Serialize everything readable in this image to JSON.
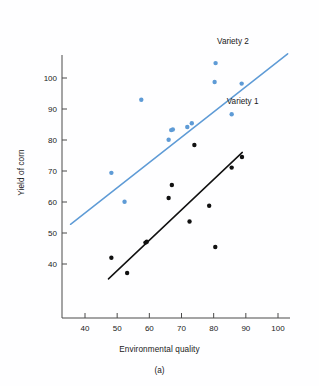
{
  "chart_data": {
    "type": "scatter",
    "title": "",
    "panel_label": "(a)",
    "xlabel": "Environmental quality",
    "ylabel": "Yield of corn",
    "xlim": [
      32,
      104
    ],
    "ylim": [
      30,
      110
    ],
    "xticks": [
      40,
      50,
      60,
      70,
      80,
      90,
      100
    ],
    "yticks": [
      40,
      50,
      60,
      70,
      80,
      90,
      100
    ],
    "grid": false,
    "legend_position": "inline-right-of-line",
    "series": [
      {
        "name": "Variety 2",
        "color": "#5e9bd6",
        "label_x": 86,
        "label_y": 112,
        "fit_line": {
          "x1": 35.5,
          "y1": 52.8,
          "x2": 103.0,
          "y2": 107.8
        },
        "points": [
          {
            "x": 48.2,
            "y": 69.4
          },
          {
            "x": 52.3,
            "y": 60.1
          },
          {
            "x": 57.5,
            "y": 93.0
          },
          {
            "x": 66.0,
            "y": 80.1
          },
          {
            "x": 66.8,
            "y": 83.2
          },
          {
            "x": 67.3,
            "y": 83.4
          },
          {
            "x": 71.8,
            "y": 84.2
          },
          {
            "x": 73.2,
            "y": 85.4
          },
          {
            "x": 80.3,
            "y": 98.7
          },
          {
            "x": 80.6,
            "y": 104.8
          },
          {
            "x": 85.6,
            "y": 88.3
          },
          {
            "x": 88.7,
            "y": 98.2
          }
        ]
      },
      {
        "name": "Variety 1",
        "color": "#111111",
        "label_x": 89,
        "label_y": 92.5,
        "fit_line": {
          "x1": 47.3,
          "y1": 35.2,
          "x2": 88.9,
          "y2": 76.0
        },
        "points": [
          {
            "x": 48.2,
            "y": 42.0
          },
          {
            "x": 53.1,
            "y": 37.1
          },
          {
            "x": 58.8,
            "y": 46.9
          },
          {
            "x": 59.2,
            "y": 47.2
          },
          {
            "x": 66.0,
            "y": 61.3
          },
          {
            "x": 67.0,
            "y": 65.5
          },
          {
            "x": 72.5,
            "y": 53.7
          },
          {
            "x": 74.0,
            "y": 78.4
          },
          {
            "x": 78.6,
            "y": 58.8
          },
          {
            "x": 80.5,
            "y": 45.5
          },
          {
            "x": 85.6,
            "y": 71.1
          },
          {
            "x": 88.8,
            "y": 74.5
          }
        ]
      }
    ]
  }
}
